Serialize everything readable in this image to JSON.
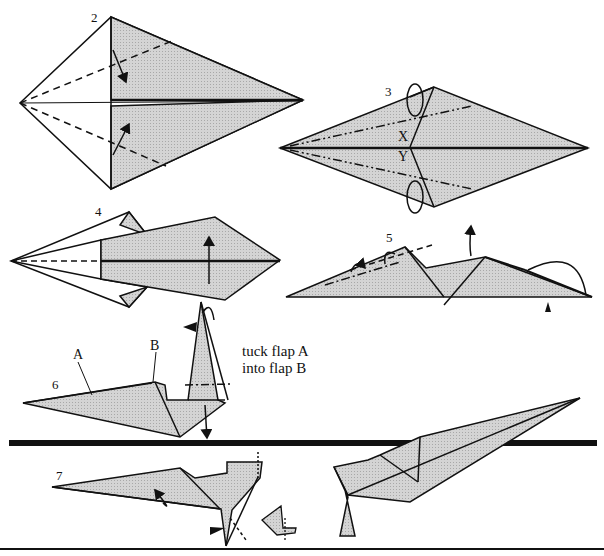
{
  "diagram": {
    "type": "origami folding instructions",
    "colors": {
      "paper_shade": "#c9c9c9",
      "line": "#111111",
      "background": "#ffffff"
    },
    "steps": [
      {
        "number": "2",
        "description": "Kite shape; valley-fold edges toward centre (dashed lines with arrows)"
      },
      {
        "number": "3",
        "description": "Mountain-fold (dash-dot lines) flaps behind; points marked X and Y",
        "marks": [
          "X",
          "Y"
        ]
      },
      {
        "number": "4",
        "description": "Valley-fold model in half along centre line, arrow up"
      },
      {
        "number": "5",
        "description": "Inside-reverse fold; mountain folds at left; push-arrow at right"
      },
      {
        "number": "6",
        "description": "Tuck flap A into flap B",
        "labels": [
          "A",
          "B"
        ],
        "note_line1": "tuck flap A",
        "note_line2": "into flap B"
      },
      {
        "number": "7",
        "description": "Shape head and feet; detail inset"
      }
    ]
  }
}
